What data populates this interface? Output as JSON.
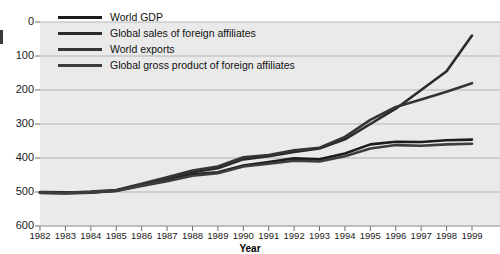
{
  "chart_data": {
    "type": "line",
    "title": "",
    "xlabel": "Year",
    "ylabel": "",
    "xlim": [
      1982,
      1999
    ],
    "ylim": [
      0,
      600
    ],
    "grid": true,
    "legend_position": "top-left",
    "note": "Indexed series, 1982 = 100",
    "x": [
      1982,
      1983,
      1984,
      1985,
      1986,
      1987,
      1988,
      1989,
      1990,
      1991,
      1992,
      1993,
      1994,
      1995,
      1996,
      1997,
      1998,
      1999
    ],
    "categories": [
      "1982",
      "1983",
      "1984",
      "1985",
      "1986",
      "1987",
      "1988",
      "1989",
      "1990",
      "1991",
      "1992",
      "1993",
      "1994",
      "1995",
      "1996",
      "1997",
      "1998",
      "1999"
    ],
    "yticks": [
      0,
      100,
      200,
      300,
      400,
      500,
      600
    ],
    "series": [
      {
        "name": "World GDP",
        "color": "#1c1c1c",
        "values": [
          100,
          99,
          100,
          104,
          120,
          136,
          152,
          158,
          178,
          188,
          199,
          196,
          213,
          240,
          248,
          247,
          252,
          254
        ]
      },
      {
        "name": "Global sales of foreign affiliates",
        "color": "#2a2a2a",
        "values": [
          97,
          96,
          98,
          104,
          122,
          140,
          158,
          170,
          196,
          205,
          218,
          228,
          255,
          300,
          345,
          400,
          455,
          560
        ]
      },
      {
        "name": "World exports",
        "color": "#343434",
        "values": [
          99,
          98,
          101,
          106,
          124,
          143,
          163,
          175,
          202,
          209,
          223,
          230,
          262,
          312,
          350,
          372,
          395,
          420
        ]
      },
      {
        "name": "Global gross product of foreign affiliates",
        "color": "#3d3d3d",
        "values": [
          98,
          97,
          99,
          103,
          118,
          132,
          148,
          155,
          175,
          183,
          192,
          190,
          205,
          228,
          238,
          236,
          240,
          242
        ]
      }
    ]
  },
  "legend": {
    "items": [
      {
        "label": "World GDP"
      },
      {
        "label": "Global sales of foreign affiliates"
      },
      {
        "label": "World exports"
      },
      {
        "label": "Global gross product of foreign affiliates"
      }
    ]
  },
  "axes": {
    "y_tick_labels": [
      "600",
      "500",
      "400",
      "300",
      "200",
      "100",
      "0"
    ],
    "x_tick_labels": [
      "1982",
      "1983",
      "1984",
      "1985",
      "1986",
      "1987",
      "1988",
      "1989",
      "1990",
      "1991",
      "1992",
      "1993",
      "1994",
      "1995",
      "1996",
      "1997",
      "1998",
      "1999"
    ],
    "x_title": "Year"
  },
  "colors": {
    "plot_background": "#eaeaea",
    "page_background": "#ffffff",
    "gridline": "#b4b4b4",
    "axis_text": "#1a1a1a",
    "line_default": "#262626"
  }
}
